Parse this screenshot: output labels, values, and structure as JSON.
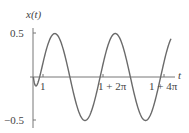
{
  "chart_data": {
    "type": "line",
    "title": "",
    "xlabel": "t",
    "ylabel": "x(t)",
    "x_ticks": [
      {
        "value": 1,
        "label": "1"
      },
      {
        "value": 7.2832,
        "label": "1 + 2π"
      },
      {
        "value": 13.5664,
        "label": "1 + 4π"
      }
    ],
    "y_ticks": [
      {
        "value": 0.5,
        "label": "0.5"
      },
      {
        "value": -0.5,
        "label": "−0.5"
      }
    ],
    "xlim": [
      0,
      14.8
    ],
    "ylim": [
      -0.55,
      0.55
    ],
    "grid": false,
    "legend": null,
    "series": [
      {
        "name": "x(t)",
        "color": "#666666",
        "description": "Sinusoid of amplitude ~0.5, period 2π, starting near t=0 with a smooth onset; approximately 0.5·sin(t−1) for t ≥ 1",
        "x": [
          0,
          0.5,
          1,
          1.5,
          2,
          2.57,
          3,
          3.5,
          4.14,
          4.5,
          5,
          5.71,
          6,
          6.5,
          7.28,
          7.8,
          8.85,
          9.5,
          10.42,
          11,
          11.99,
          12.5,
          13.57,
          14.2
        ],
        "y": [
          0,
          0.01,
          0.05,
          0.22,
          0.38,
          0.5,
          0.46,
          0.3,
          0.0,
          -0.17,
          -0.38,
          -0.5,
          -0.48,
          -0.36,
          0.0,
          0.25,
          0.5,
          0.4,
          0.0,
          -0.23,
          -0.5,
          -0.42,
          0.0,
          0.29
        ]
      }
    ]
  },
  "labels": {
    "ylabel": "x(t)",
    "xlabel": "t",
    "ytick_pos": "0.5",
    "ytick_neg": "−0.5",
    "xtick_1": "1",
    "xtick_2": "1 + 2π",
    "xtick_3": "1 + 4π"
  }
}
